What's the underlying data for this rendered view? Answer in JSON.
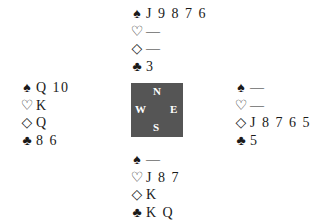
{
  "suit_symbols": {
    "spades": "♠",
    "hearts": "♡",
    "diamonds": "◇",
    "clubs": "♣"
  },
  "hands": {
    "north": {
      "spades": "J 9 8 7 6",
      "hearts": "—",
      "diamonds": "—",
      "clubs": "3"
    },
    "west": {
      "spades": "Q 10",
      "hearts": "K",
      "diamonds": "Q",
      "clubs": "8 6"
    },
    "east": {
      "spades": "—",
      "hearts": "—",
      "diamonds": "J 8 7 6 5",
      "clubs": "5"
    },
    "south": {
      "spades": "—",
      "hearts": "J 8 7",
      "diamonds": "K",
      "clubs": "K Q"
    }
  },
  "compass": {
    "north": "N",
    "west": "W",
    "east": "E",
    "south": "S",
    "background": "#555555"
  }
}
